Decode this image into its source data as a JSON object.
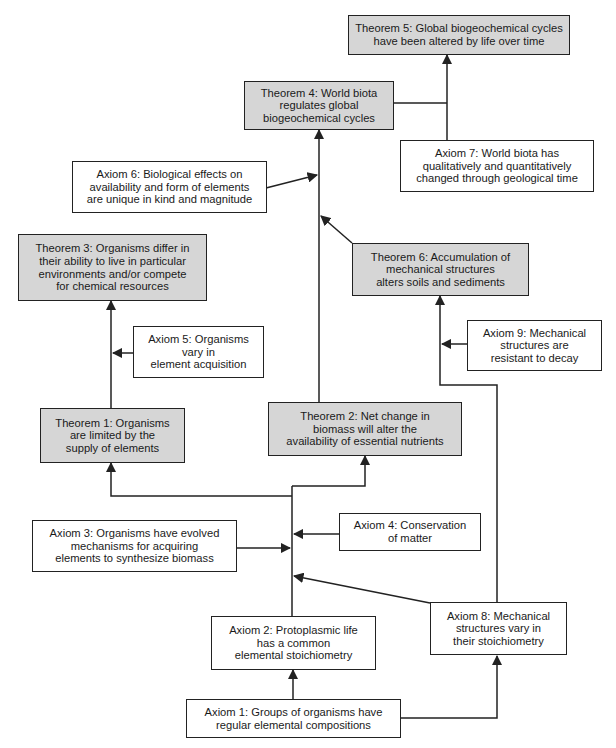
{
  "diagram": {
    "colors": {
      "theorem_fill": "#d6d6d6",
      "axiom_fill": "#ffffff",
      "line": "#222222"
    },
    "nodes": [
      {
        "id": "theorem5",
        "type": "theorem",
        "text": "Theorem 5:  Global biogeochemical cycles\nhave been altered by life over time"
      },
      {
        "id": "theorem4",
        "type": "theorem",
        "text": "Theorem 4:  World biota\nregulates global\nbiogeochemical cycles"
      },
      {
        "id": "axiom7",
        "type": "axiom",
        "text": "Axiom 7: World biota has\nqualitatively and quantitatively\nchanged through geological time"
      },
      {
        "id": "axiom6",
        "type": "axiom",
        "text": "Axiom 6: Biological effects on\navailability and form of elements\nare unique in kind and magnitude"
      },
      {
        "id": "theorem3",
        "type": "theorem",
        "text": "Theorem 3:  Organisms differ in\ntheir ability to live in particular\nenvironments and/or compete\nfor chemical resources"
      },
      {
        "id": "theorem6",
        "type": "theorem",
        "text": "Theorem 6:  Accumulation of\nmechanical structures\nalters soils and sediments"
      },
      {
        "id": "axiom9",
        "type": "axiom",
        "text": "Axiom 9:  Mechanical\nstructures are\nresistant to decay"
      },
      {
        "id": "axiom5",
        "type": "axiom",
        "text": "Axiom 5:  Organisms\nvary in\nelement acquisition"
      },
      {
        "id": "theorem1",
        "type": "theorem",
        "text": "Theorem 1:  Organisms\nare limited by the\nsupply of elements"
      },
      {
        "id": "theorem2",
        "type": "theorem",
        "text": "Theorem 2:  Net change in\nbiomass will alter the\navailability of essential nutrients"
      },
      {
        "id": "axiom3",
        "type": "axiom",
        "text": "Axiom 3:  Organisms have evolved\nmechanisms for acquiring\nelements to synthesize biomass"
      },
      {
        "id": "axiom4",
        "type": "axiom",
        "text": "Axiom 4: Conservation\nof matter"
      },
      {
        "id": "axiom2",
        "type": "axiom",
        "text": "Axiom 2:  Protoplasmic life\nhas a common\nelemental stoichiometry"
      },
      {
        "id": "axiom8",
        "type": "axiom",
        "text": "Axiom 8:  Mechanical\nstructures vary in\ntheir stoichiometry"
      },
      {
        "id": "axiom1",
        "type": "axiom",
        "text": "Axiom 1:  Groups of organisms have\nregular elemental compositions"
      }
    ],
    "edges": [
      {
        "from": "axiom1",
        "to": "axiom2"
      },
      {
        "from": "axiom1",
        "to": "axiom8"
      },
      {
        "from": "axiom2",
        "to": "theorem1"
      },
      {
        "from": "axiom2",
        "to": "theorem2"
      },
      {
        "from": "axiom3",
        "to": "theorem1"
      },
      {
        "from": "axiom3",
        "to": "theorem2"
      },
      {
        "from": "axiom4",
        "to": "theorem1"
      },
      {
        "from": "axiom4",
        "to": "theorem2"
      },
      {
        "from": "axiom8",
        "to": "theorem1"
      },
      {
        "from": "axiom8",
        "to": "theorem2"
      },
      {
        "from": "theorem1",
        "to": "theorem3"
      },
      {
        "from": "axiom5",
        "to": "theorem3"
      },
      {
        "from": "theorem2",
        "to": "theorem4"
      },
      {
        "from": "axiom6",
        "to": "theorem4"
      },
      {
        "from": "theorem6",
        "to": "theorem4"
      },
      {
        "from": "theorem2",
        "to": "theorem6"
      },
      {
        "from": "axiom9",
        "to": "theorem6"
      },
      {
        "from": "theorem4",
        "to": "theorem5"
      },
      {
        "from": "axiom7",
        "to": "theorem5"
      }
    ]
  }
}
